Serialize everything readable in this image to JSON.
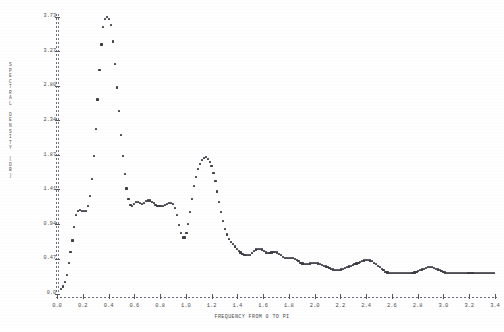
{
  "chart_data": {
    "type": "scatter",
    "title": "",
    "subtitle": "",
    "xlabel": "FREQUENCY FROM 0 TO PI",
    "ylabel": "SPECTRAL DENSITY (DB)",
    "ylabel_chars": [
      "S",
      "P",
      "E",
      "C",
      "T",
      "R",
      "A",
      "L",
      " ",
      "D",
      "E",
      "N",
      "S",
      "I",
      "T",
      "Y",
      " ",
      "(",
      "D",
      "B",
      ")"
    ],
    "xlim": [
      0.0,
      3.4
    ],
    "ylim": [
      0.0,
      3.73
    ],
    "grid": false,
    "legend": null,
    "xticks": [
      "0.0",
      "0.2",
      "0.4",
      "0.6",
      "0.8",
      "1.0",
      "1.2",
      "1.4",
      "1.6",
      "1.8",
      "2.0",
      "2.2",
      "2.4",
      "2.6",
      "2.8",
      "3.0",
      "3.2",
      "3.4"
    ],
    "xtick_values": [
      0.0,
      0.2,
      0.4,
      0.6,
      0.8,
      1.0,
      1.2,
      1.4,
      1.6,
      1.8,
      2.0,
      2.2,
      2.4,
      2.6,
      2.8,
      3.0,
      3.2,
      3.4
    ],
    "yticks": [
      "3.73",
      "3.27",
      "2.80",
      "2.34",
      "1.87",
      "1.41",
      "0.94",
      "0.47",
      "0.0"
    ],
    "ytick_values": [
      3.73,
      3.27,
      2.8,
      2.34,
      1.87,
      1.41,
      0.94,
      0.47,
      0.0
    ],
    "marker": "*",
    "marker_color": "#3d3d46",
    "axis_color": "#6a6a7a",
    "background": "#ffffff",
    "x": [
      0.03,
      0.045,
      0.06,
      0.075,
      0.09,
      0.105,
      0.12,
      0.135,
      0.15,
      0.165,
      0.18,
      0.195,
      0.21,
      0.225,
      0.24,
      0.255,
      0.27,
      0.285,
      0.3,
      0.315,
      0.33,
      0.345,
      0.36,
      0.375,
      0.39,
      0.405,
      0.42,
      0.435,
      0.45,
      0.465,
      0.48,
      0.495,
      0.51,
      0.525,
      0.54,
      0.555,
      0.57,
      0.585,
      0.6,
      0.615,
      0.63,
      0.645,
      0.66,
      0.675,
      0.69,
      0.705,
      0.72,
      0.735,
      0.75,
      0.765,
      0.78,
      0.795,
      0.81,
      0.825,
      0.84,
      0.855,
      0.87,
      0.885,
      0.9,
      0.915,
      0.93,
      0.945,
      0.96,
      0.975,
      0.99,
      1.005,
      1.02,
      1.035,
      1.05,
      1.065,
      1.08,
      1.095,
      1.11,
      1.125,
      1.14,
      1.155,
      1.17,
      1.185,
      1.2,
      1.215,
      1.23,
      1.245,
      1.26,
      1.275,
      1.29,
      1.305,
      1.32,
      1.335,
      1.35,
      1.365,
      1.38,
      1.395,
      1.41,
      1.425,
      1.44,
      1.455,
      1.47,
      1.485,
      1.5,
      1.515,
      1.53,
      1.545,
      1.56,
      1.575,
      1.59,
      1.605,
      1.62,
      1.635,
      1.65,
      1.665,
      1.68,
      1.695,
      1.71,
      1.725,
      1.74,
      1.755,
      1.77,
      1.785,
      1.8,
      1.815,
      1.83,
      1.845,
      1.86,
      1.875,
      1.89,
      1.905,
      1.92,
      1.935,
      1.95,
      1.965,
      1.98,
      1.995,
      2.01,
      2.025,
      2.04,
      2.055,
      2.07,
      2.085,
      2.1,
      2.115,
      2.13,
      2.145,
      2.16,
      2.175,
      2.19,
      2.205,
      2.22,
      2.235,
      2.25,
      2.265,
      2.28,
      2.295,
      2.31,
      2.325,
      2.34,
      2.355,
      2.37,
      2.385,
      2.4,
      2.415,
      2.43,
      2.445,
      2.46,
      2.475,
      2.49,
      2.505,
      2.52,
      2.535,
      2.55,
      2.565,
      2.58,
      2.595,
      2.61,
      2.625,
      2.64,
      2.655,
      2.67,
      2.685,
      2.7,
      2.715,
      2.73,
      2.745,
      2.76,
      2.775,
      2.79,
      2.805,
      2.82,
      2.835,
      2.85,
      2.865,
      2.88,
      2.895,
      2.91,
      2.925,
      2.94,
      2.955,
      2.97,
      2.985,
      3.0,
      3.015,
      3.03,
      3.045,
      3.06,
      3.075,
      3.09,
      3.105,
      3.12,
      3.135,
      3.15,
      3.165,
      3.18,
      3.195,
      3.21,
      3.225,
      3.24,
      3.255,
      3.27,
      3.285,
      3.3,
      3.315,
      3.33,
      3.345,
      3.36,
      3.375,
      3.39
    ],
    "y": [
      0.07,
      0.1,
      0.16,
      0.26,
      0.42,
      0.57,
      0.72,
      0.9,
      1.06,
      1.12,
      1.13,
      1.12,
      1.12,
      1.12,
      1.18,
      1.32,
      1.55,
      1.86,
      2.22,
      2.62,
      3.02,
      3.36,
      3.6,
      3.7,
      3.73,
      3.7,
      3.62,
      3.4,
      3.1,
      2.78,
      2.46,
      2.14,
      1.86,
      1.62,
      1.42,
      1.28,
      1.2,
      1.18,
      1.21,
      1.24,
      1.24,
      1.22,
      1.21,
      1.22,
      1.25,
      1.26,
      1.26,
      1.24,
      1.22,
      1.2,
      1.19,
      1.18,
      1.18,
      1.19,
      1.2,
      1.21,
      1.22,
      1.22,
      1.21,
      1.16,
      1.06,
      0.93,
      0.82,
      0.76,
      0.76,
      0.82,
      0.94,
      1.1,
      1.28,
      1.45,
      1.58,
      1.68,
      1.75,
      1.8,
      1.83,
      1.84,
      1.82,
      1.78,
      1.72,
      1.63,
      1.52,
      1.38,
      1.24,
      1.1,
      0.98,
      0.88,
      0.8,
      0.74,
      0.7,
      0.67,
      0.64,
      0.61,
      0.58,
      0.56,
      0.54,
      0.53,
      0.52,
      0.52,
      0.53,
      0.55,
      0.58,
      0.6,
      0.61,
      0.61,
      0.6,
      0.58,
      0.56,
      0.55,
      0.55,
      0.56,
      0.57,
      0.57,
      0.56,
      0.54,
      0.52,
      0.5,
      0.49,
      0.48,
      0.48,
      0.48,
      0.48,
      0.47,
      0.46,
      0.44,
      0.42,
      0.41,
      0.4,
      0.4,
      0.4,
      0.41,
      0.42,
      0.42,
      0.42,
      0.41,
      0.4,
      0.39,
      0.38,
      0.37,
      0.36,
      0.35,
      0.34,
      0.33,
      0.32,
      0.32,
      0.32,
      0.33,
      0.34,
      0.35,
      0.36,
      0.37,
      0.38,
      0.39,
      0.4,
      0.41,
      0.42,
      0.43,
      0.44,
      0.45,
      0.46,
      0.46,
      0.45,
      0.44,
      0.42,
      0.4,
      0.38,
      0.36,
      0.34,
      0.32,
      0.3,
      0.29,
      0.28,
      0.28,
      0.28,
      0.28,
      0.28,
      0.28,
      0.28,
      0.28,
      0.28,
      0.28,
      0.28,
      0.28,
      0.28,
      0.29,
      0.3,
      0.31,
      0.32,
      0.33,
      0.34,
      0.35,
      0.36,
      0.36,
      0.36,
      0.35,
      0.34,
      0.33,
      0.32,
      0.31,
      0.3,
      0.29,
      0.28,
      0.28,
      0.28,
      0.28,
      0.28,
      0.28,
      0.28,
      0.28,
      0.28,
      0.28,
      0.28,
      0.28,
      0.28,
      0.28,
      0.28,
      0.28,
      0.28,
      0.28,
      0.28,
      0.28,
      0.28,
      0.28,
      0.28,
      0.28,
      0.28
    ]
  }
}
